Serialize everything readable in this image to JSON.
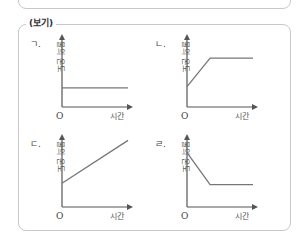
{
  "bogi": {
    "label": "(보기)"
  },
  "axes": {
    "y_label": "물의 온도",
    "x_label": "시간",
    "origin": "O"
  },
  "colors": {
    "frame": "#c8c8c8",
    "axis": "#555555",
    "curve": "#777777"
  },
  "chart_data": [
    {
      "id": "ㄱ",
      "label": "ㄱ.",
      "type": "line",
      "xlabel": "시간",
      "ylabel": "물의 온도",
      "description": "constant temperature",
      "points": [
        [
          0,
          0.28
        ],
        [
          1,
          0.28
        ]
      ]
    },
    {
      "id": "ㄴ",
      "label": "ㄴ.",
      "type": "line",
      "xlabel": "시간",
      "ylabel": "물의 온도",
      "description": "rises then stays constant",
      "points": [
        [
          0,
          0.3
        ],
        [
          0.35,
          0.72
        ],
        [
          1,
          0.72
        ]
      ]
    },
    {
      "id": "ㄷ",
      "label": "ㄷ.",
      "type": "line",
      "xlabel": "시간",
      "ylabel": "물의 온도",
      "description": "rises steadily",
      "points": [
        [
          0,
          0.35
        ],
        [
          1,
          0.98
        ]
      ]
    },
    {
      "id": "ㄹ",
      "label": "ㄹ.",
      "type": "line",
      "xlabel": "시간",
      "ylabel": "물의 온도",
      "description": "falls then stays constant",
      "points": [
        [
          0,
          0.8
        ],
        [
          0.35,
          0.33
        ],
        [
          1,
          0.33
        ]
      ]
    }
  ]
}
